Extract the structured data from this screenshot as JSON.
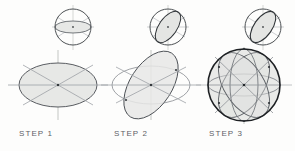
{
  "figure": {
    "background_color": "#fdfdfc",
    "width": 295,
    "height": 151
  },
  "palette": {
    "construction_line": "#b9bcc0",
    "light_stroke": "#a7abb0",
    "mid_stroke": "#6f7479",
    "dark_stroke": "#2f3337",
    "bold_stroke": "#1d2023",
    "fill_tint": "#e7e8e6",
    "fill_tint_strong": "#dedfdc",
    "label_color": "#5d6166",
    "vertical_axis": "#c3c6c3"
  },
  "steps": [
    {
      "id": "step-1",
      "label": "STEP 1",
      "label_x": 19,
      "label_y": 129,
      "small_sphere": {
        "cx": 73,
        "cy": 27,
        "r": 18,
        "equator_rx": 18,
        "equator_ry": 6,
        "equator_rotation": 0,
        "shaded": true
      },
      "main_shape": {
        "type": "ellipse",
        "cx": 58,
        "cy": 85,
        "rx": 39,
        "ry": 22,
        "rotation": 0,
        "shaded": true,
        "diameters": 3
      },
      "axes": {
        "horizontal_extent": 50,
        "vertical_extent": 46
      }
    },
    {
      "id": "step-2",
      "label": "STEP 2",
      "label_x": 114,
      "label_y": 129,
      "small_sphere": {
        "cx": 168,
        "cy": 27,
        "r": 18,
        "equator_rx": 18,
        "equator_ry": 9,
        "equator_rotation": -55,
        "shaded": true
      },
      "main_shape": {
        "type": "two-ellipses",
        "cx": 151,
        "cy": 85,
        "base_rx": 39,
        "base_ry": 19,
        "tilted_rx": 38,
        "tilted_ry": 21,
        "tilted_rotation": -57,
        "shaded": true,
        "diameters": 3
      },
      "axes": {
        "horizontal_extent": 50,
        "vertical_extent": 46
      }
    },
    {
      "id": "step-3",
      "label": "STEP 3",
      "label_x": 209,
      "label_y": 129,
      "small_sphere": {
        "cx": 263,
        "cy": 27,
        "r": 18,
        "equator_rx": 18,
        "equator_ry": 9,
        "equator_rotation": -55,
        "shaded": true
      },
      "main_shape": {
        "type": "wireframe-sphere",
        "cx": 244,
        "cy": 85,
        "r": 36,
        "outline_weight": 1.6,
        "shaded": true,
        "meridians": [
          {
            "rx": 36,
            "ry": 11,
            "rotation": 0
          },
          {
            "rx": 36,
            "ry": 20,
            "rotation": -58
          },
          {
            "rx": 36,
            "ry": 20,
            "rotation": 58
          },
          {
            "rx": 36,
            "ry": 14,
            "rotation": 90
          }
        ]
      },
      "axes": {
        "horizontal_extent": 48,
        "vertical_extent": 46
      }
    }
  ]
}
